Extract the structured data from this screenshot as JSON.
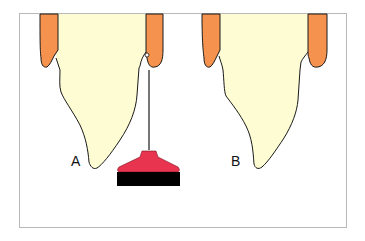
{
  "figure": {
    "panels": [
      {
        "id": "A",
        "label": "A",
        "description": "tooth with dental brush hanging from gingival margin"
      },
      {
        "id": "B",
        "label": "B",
        "description": "tooth without brush"
      }
    ],
    "colors": {
      "gingiva": "#F4924E",
      "tooth": "#FEFCD2",
      "outline": "#1a1a1a",
      "brush_head": "#E8344E",
      "brush_bristles": "#000000",
      "frame": "#B8B8B8"
    }
  }
}
